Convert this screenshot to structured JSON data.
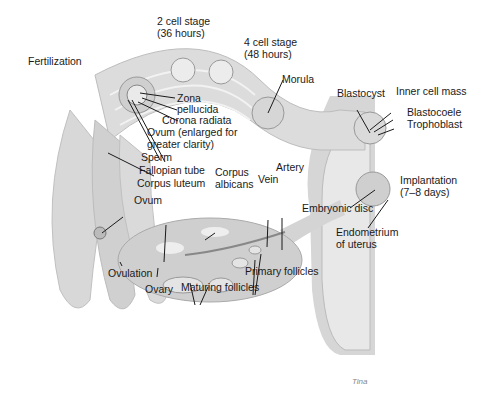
{
  "colors": {
    "tissue_light": "#e4e4e4",
    "tissue_mid": "#c8c8c8",
    "tissue_dark": "#9a9a9a",
    "line": "#1a1a1a",
    "background": "#ffffff"
  },
  "labels": {
    "fertilization": "Fertilization",
    "two_cell_1": "2 cell stage",
    "two_cell_2": "(36 hours)",
    "four_cell_1": "4 cell stage",
    "four_cell_2": "(48 hours)",
    "morula": "Morula",
    "blastocyst": "Blastocyst",
    "inner_cell_mass": "Inner cell mass",
    "blastocoele": "Blastocoele",
    "trophoblast": "Trophoblast",
    "zona_1": "Zona",
    "zona_2": "pellucida",
    "corona": "Corona radiata",
    "ovum_enl_1": "Ovum (enlarged for",
    "ovum_enl_2": "greater clarity)",
    "sperm": "Sperm",
    "fallopian": "Fallopian tube",
    "corpus_luteum": "Corpus luteum",
    "corpus_alb_1": "Corpus",
    "corpus_alb_2": "albicans",
    "vein": "Vein",
    "artery": "Artery",
    "ovum": "Ovum",
    "implant_1": "Implantation",
    "implant_2": "(7–8 days)",
    "embryonic_disc": "Embryonic disc",
    "endo_1": "Endometrium",
    "endo_2": "of uterus",
    "ovulation": "Ovulation",
    "ovary": "Ovary",
    "maturing": "Maturing follicles",
    "primary": "Primary follicles",
    "signature": "Tina"
  }
}
